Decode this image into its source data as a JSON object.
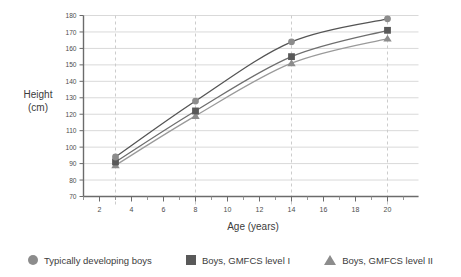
{
  "chart_data": {
    "type": "line",
    "title": "",
    "subtitle": "",
    "xlabel": "Age (years)",
    "ylabel": "Height\n(cm)",
    "ylabel_line1": "Height",
    "ylabel_line2": "(cm)",
    "x": [
      3,
      8,
      14,
      20
    ],
    "xlim": [
      1,
      21
    ],
    "ylim": [
      70,
      180
    ],
    "xticks": [
      2,
      4,
      6,
      8,
      10,
      12,
      14,
      16,
      18,
      20
    ],
    "xtick_labels": [
      "2",
      "4",
      "6",
      "8",
      "10",
      "12",
      "14",
      "16",
      "18",
      "20"
    ],
    "xminorticks": [
      1,
      3,
      5,
      7,
      9,
      11,
      13,
      15,
      17,
      19,
      21
    ],
    "yticks": [
      70,
      80,
      90,
      100,
      110,
      120,
      130,
      140,
      150,
      160,
      170,
      180
    ],
    "ytick_labels": [
      "70",
      "80",
      "90",
      "100",
      "110",
      "120",
      "130",
      "140",
      "150",
      "160",
      "170",
      "180"
    ],
    "grid": {
      "horizontal": true,
      "vertical": true,
      "vertical_at": [
        3,
        8,
        14,
        20
      ],
      "horizontal_color": "#d9d9d9",
      "vertical_color": "#cccccc",
      "vertical_style": "dashed"
    },
    "legend_position": "bottom",
    "series": [
      {
        "name": "Typically developing boys",
        "marker": "circle",
        "color": "#8c8c8c",
        "line_color": "#545454",
        "values": [
          94,
          128,
          164,
          178
        ]
      },
      {
        "name": "Boys, GMFCS level I",
        "marker": "square",
        "color": "#595959",
        "line_color": "#6e6e6e",
        "values": [
          91,
          122,
          155,
          171
        ]
      },
      {
        "name": "Boys, GMFCS level II",
        "marker": "triangle",
        "color": "#8c8c8c",
        "line_color": "#9a9a9a",
        "values": [
          89,
          119,
          151,
          166
        ]
      }
    ]
  },
  "legend": {
    "items": [
      {
        "label": "Typically developing boys",
        "marker": "circle",
        "color": "#8c8c8c"
      },
      {
        "label": "Boys, GMFCS level I",
        "marker": "square",
        "color": "#595959"
      },
      {
        "label": "Boys, GMFCS level II",
        "marker": "triangle",
        "color": "#8c8c8c"
      }
    ]
  }
}
